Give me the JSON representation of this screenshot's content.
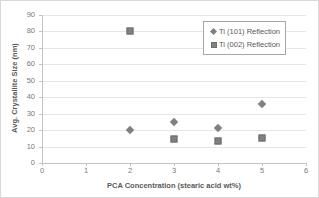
{
  "chart_data": {
    "type": "scatter",
    "title": "",
    "xlabel": "PCA Concentration (stearic acid wt%)",
    "ylabel": "Avg. Crystallite Size (nm)",
    "xlim": [
      0,
      6
    ],
    "ylim": [
      0,
      90
    ],
    "xticks": [
      "0",
      "1",
      "2",
      "3",
      "4",
      "5",
      "6"
    ],
    "yticks": [
      "0",
      "10",
      "20",
      "30",
      "40",
      "50",
      "60",
      "70",
      "80",
      "90"
    ],
    "grid": "horizontal",
    "legend_position": "top-right",
    "marker_color": "#808080",
    "series": [
      {
        "name": "Ti (101) Reflection",
        "marker": "diamond",
        "color": "#808080",
        "x": [
          2,
          3,
          4,
          5
        ],
        "values": [
          20,
          24.8,
          21.5,
          35.8
        ]
      },
      {
        "name": "Ti (002) Reflection",
        "marker": "square",
        "color": "#808080",
        "x": [
          2,
          3,
          4,
          5
        ],
        "values": [
          80,
          14.8,
          13.5,
          15.5
        ]
      }
    ]
  }
}
